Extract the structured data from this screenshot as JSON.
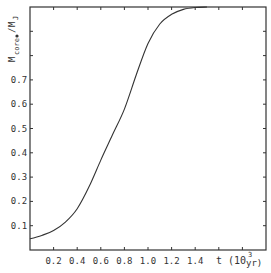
{
  "chart_data": {
    "type": "line",
    "title": "",
    "xlabel": "t (10^3 yr)",
    "xlabel_parts": {
      "main": "t (10",
      "sup": "3",
      "unit": "yr)"
    },
    "ylabel": "M_core/M_J",
    "ylabel_parts": {
      "m1": "M",
      "sub1": "core",
      "slash": "/",
      "m2": "M",
      "sub2": "J"
    },
    "xlim": [
      0,
      2.0
    ],
    "ylim": [
      0,
      1.0
    ],
    "x_ticks": [
      0.2,
      0.4,
      0.6,
      0.8,
      1.0,
      1.2,
      1.4,
      1.6,
      1.8
    ],
    "x_tick_labels": [
      "0.2",
      "0.4",
      "0.6",
      "0.8",
      "1.0",
      "1.2",
      "1.4"
    ],
    "y_ticks": [
      0.1,
      0.2,
      0.3,
      0.4,
      0.5,
      0.6,
      0.7,
      0.8,
      0.9
    ],
    "y_tick_labels": [
      "0.1",
      "0.2",
      "0.3",
      "0.4",
      "0.5",
      "0.6",
      "0.7"
    ],
    "grid": false,
    "legend": null,
    "series": [
      {
        "name": "M_core/M_J",
        "x": [
          0.0,
          0.1,
          0.2,
          0.3,
          0.4,
          0.5,
          0.6,
          0.7,
          0.8,
          0.9,
          1.0,
          1.1,
          1.2,
          1.3,
          1.4,
          1.5
        ],
        "y": [
          0.046,
          0.06,
          0.08,
          0.115,
          0.17,
          0.26,
          0.37,
          0.475,
          0.58,
          0.72,
          0.85,
          0.93,
          0.97,
          0.99,
          0.998,
          1.0
        ]
      }
    ],
    "colors": {
      "line": "#333333",
      "axes": "#333333",
      "background": "#ffffff"
    }
  }
}
